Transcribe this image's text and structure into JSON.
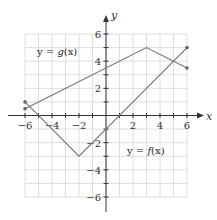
{
  "chart_data": {
    "type": "line",
    "title": "",
    "xlabel": "x",
    "ylabel": "y",
    "xlim": [
      -6,
      6
    ],
    "ylim": [
      -6,
      6
    ],
    "grid": true,
    "x_ticks": [
      -6,
      -4,
      -2,
      2,
      4,
      6
    ],
    "y_ticks": [
      6,
      4,
      2,
      -2,
      -4,
      -6
    ],
    "x_tick_labels": [
      "−6",
      "−4",
      "−2",
      "2",
      "4",
      "6"
    ],
    "y_tick_labels": [
      "6",
      "4",
      "2",
      "−2",
      "−4",
      "−6"
    ],
    "series": [
      {
        "name": "y = g(x)",
        "label_prefix": "y = ",
        "label_fn": "g",
        "label_arg": "(x)",
        "points": [
          [
            -6,
            0.5
          ],
          [
            3,
            5
          ],
          [
            6,
            3.5
          ]
        ],
        "endpoints_marked": true
      },
      {
        "name": "y = f(x)",
        "label_prefix": "y = ",
        "label_fn": "f",
        "label_arg": "(x)",
        "points": [
          [
            -6,
            1
          ],
          [
            -2,
            -3
          ],
          [
            6,
            5
          ]
        ],
        "endpoints_marked": true
      }
    ],
    "colors": {
      "line": "#777777",
      "grid": "#d6d6d6",
      "axis": "#333333",
      "point": "#666666"
    }
  }
}
